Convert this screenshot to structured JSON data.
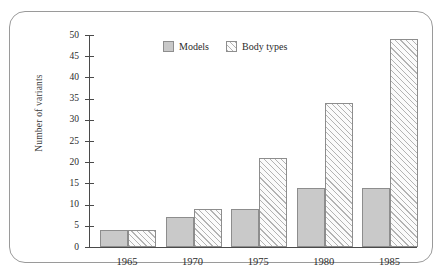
{
  "figure": {
    "top_caption": "",
    "frame_color": "#9a9a9a"
  },
  "legend": {
    "items": [
      {
        "label": "Models",
        "swatch": "solid-swatch",
        "color": "#c9c9c9"
      },
      {
        "label": "Body types",
        "swatch": "hatched-swatch",
        "color": "#b3b3b3"
      }
    ]
  },
  "chart_data": {
    "type": "bar",
    "title": "",
    "subtitle": "",
    "xlabel": "",
    "ylabel": "Number of variants",
    "categories": [
      "1965",
      "1970",
      "1975",
      "1980",
      "1985"
    ],
    "series": [
      {
        "name": "Models",
        "values": [
          4,
          7,
          9,
          14,
          14
        ]
      },
      {
        "name": "Body types",
        "values": [
          4,
          9,
          21,
          34,
          49
        ]
      }
    ],
    "ylim": [
      0,
      50
    ],
    "ytick_step": 5,
    "yticks": [
      0,
      5,
      10,
      15,
      20,
      25,
      30,
      35,
      40,
      45,
      50
    ],
    "ytick_labels": [
      "0",
      "5",
      "10",
      "15",
      "20",
      "25",
      "30",
      "35",
      "40",
      "45",
      "50"
    ],
    "grid": false,
    "legend_position": "top-center",
    "annotations": []
  }
}
